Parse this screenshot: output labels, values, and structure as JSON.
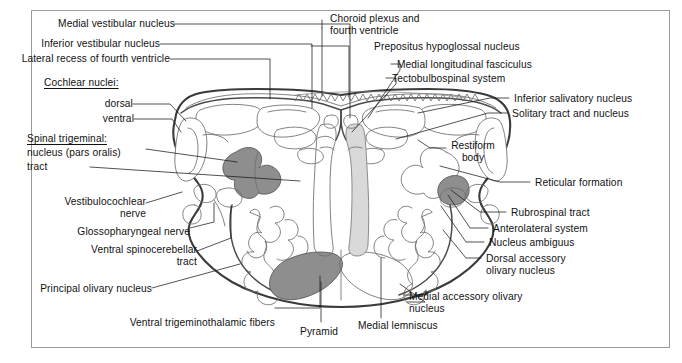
{
  "figure": {
    "type": "anatomical-cross-section",
    "region": "medulla oblongata (rostral, mid-olivary level)",
    "frame_color": "#9b9b9b",
    "background_color": "#ffffff",
    "outline_color": "#3a3a3a",
    "shading": {
      "dark_gray": "#8c8c8c",
      "mid_gray": "#9a9a9a",
      "light_gray": "#d8d8d8",
      "white": "#ffffff"
    }
  },
  "labels_left": [
    {
      "id": "medial-vestibular-nucleus",
      "text": "Medial vestibular nucleus"
    },
    {
      "id": "inferior-vestibular-nucleus",
      "text": "Inferior vestibular nucleus"
    },
    {
      "id": "lateral-recess-of-fourth-ventricle",
      "text": "Lateral recess of fourth ventricle"
    },
    {
      "id": "cochlear-nuclei",
      "text": "Cochlear nuclei:"
    },
    {
      "id": "cochlear-dorsal",
      "text": "dorsal"
    },
    {
      "id": "cochlear-ventral",
      "text": "ventral"
    },
    {
      "id": "spinal-trigeminal",
      "text": "Spinal trigeminal:"
    },
    {
      "id": "spinal-trigeminal-nucleus",
      "text": "nucleus (pars oralis)"
    },
    {
      "id": "spinal-trigeminal-tract",
      "text": "tract"
    },
    {
      "id": "vestibulocochlear-nerve",
      "text": "Vestibulocochlear\nnerve"
    },
    {
      "id": "glossopharyngeal-nerve",
      "text": "Glossopharyngeal nerve"
    },
    {
      "id": "ventral-spinocerebellar-tract",
      "text": "Ventral spinocerebellar\ntract"
    },
    {
      "id": "principal-olivary-nucleus",
      "text": "Principal olivary nucleus"
    },
    {
      "id": "ventral-trigeminothalamic-fibers",
      "text": "Ventral trigeminothalamic fibers"
    }
  ],
  "labels_top": [
    {
      "id": "choroid-plexus-and-fourth-ventricle",
      "text": "Choroid plexus and\nfourth ventricle"
    },
    {
      "id": "prepositus-hypoglossal-nucleus",
      "text": "Prepositus hypoglossal nucleus"
    },
    {
      "id": "medial-longitudinal-fasciculus",
      "text": "Medial longitudinal fasciculus"
    },
    {
      "id": "tectobulbospinal-system",
      "text": "Tectobulbospinal system"
    }
  ],
  "labels_right": [
    {
      "id": "inferior-salivatory-nucleus",
      "text": "Inferior salivatory nucleus"
    },
    {
      "id": "solitary-tract-and-nucleus",
      "text": "Solitary tract and nucleus"
    },
    {
      "id": "reticular-formation",
      "text": "Reticular formation"
    },
    {
      "id": "rubrospinal-tract",
      "text": "Rubrospinal tract"
    },
    {
      "id": "anterolateral-system",
      "text": "Anterolateral system"
    },
    {
      "id": "nucleus-ambiguus",
      "text": "Nucleus ambiguus"
    },
    {
      "id": "dorsal-accessory-olivary-nucleus",
      "text": "Dorsal accessory\nolivary nucleus"
    },
    {
      "id": "medial-accessory-olivary-nucleus",
      "text": "Medial accessory olivary\nnucleus"
    }
  ],
  "labels_bottom": [
    {
      "id": "pyramid",
      "text": "Pyramid"
    },
    {
      "id": "medial-lemniscus",
      "text": "Medial lemniscus"
    }
  ],
  "labels_interior": [
    {
      "id": "restiform-body",
      "text": "Restiform\nbody"
    }
  ]
}
